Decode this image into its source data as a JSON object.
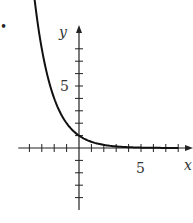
{
  "marker": "•",
  "chart_data": {
    "type": "line",
    "title": "",
    "xlabel": "x",
    "ylabel": "y",
    "xlim": [
      -5,
      9
    ],
    "ylim": [
      -5,
      10
    ],
    "x_ticks": [
      -4,
      -3,
      -2,
      -1,
      1,
      2,
      3,
      4,
      5,
      6,
      7,
      8
    ],
    "y_ticks": [
      -4,
      -3,
      -2,
      -1,
      1,
      2,
      3,
      4,
      5,
      6,
      7,
      8
    ],
    "x_tick_labels": [
      {
        "value": 5,
        "label": "5"
      }
    ],
    "y_tick_labels": [
      {
        "value": 5,
        "label": "5"
      }
    ],
    "grid": false,
    "series": [
      {
        "name": "y = (1/2)^x",
        "x": [
          -3.7,
          -3,
          -2.5,
          -2,
          -1.5,
          -1,
          -0.5,
          0,
          1,
          2,
          3,
          4,
          5,
          6,
          7,
          8
        ],
        "values": [
          10,
          8,
          5.66,
          4,
          2.83,
          2,
          1.41,
          1,
          0.5,
          0.25,
          0.125,
          0.06,
          0.03,
          0.016,
          0.008,
          0.004
        ]
      }
    ],
    "color": "#111111"
  }
}
